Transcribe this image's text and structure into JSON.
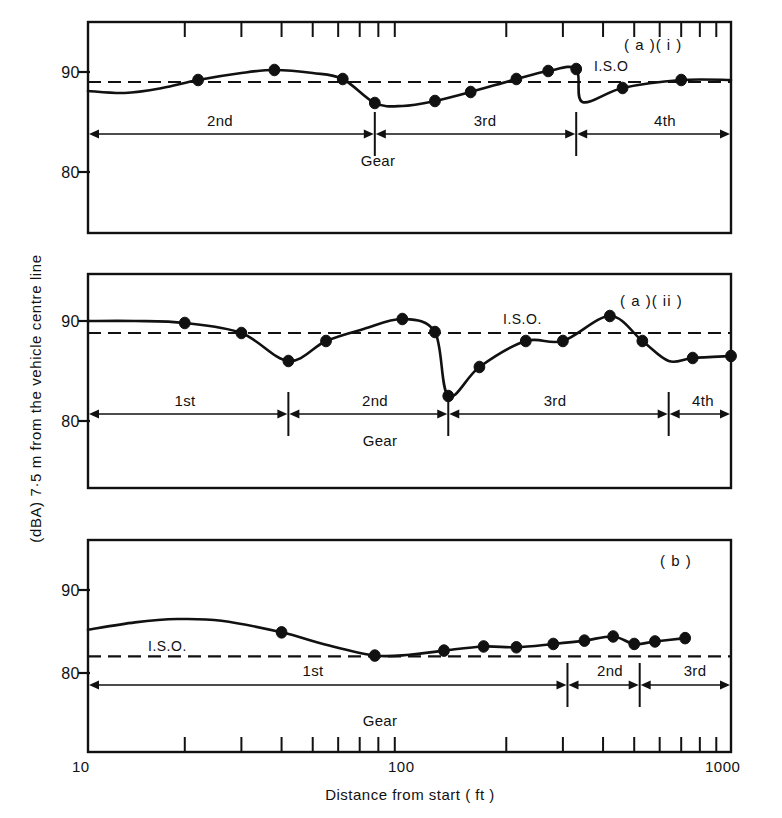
{
  "figure": {
    "axis_title_y": "(dBA) 7·5 m from the vehicle centre line",
    "axis_title_x": "Distance from start  ( ft )",
    "x_tick_labels": [
      "10",
      "100",
      "1000"
    ],
    "gear_caption": "Gear",
    "iso_label_short": "I.S.O",
    "iso_label_long": "I.S.O."
  },
  "chart_data": {
    "type": "line",
    "xlabel": "Distance from start  ( ft )",
    "ylabel": "(dBA) 7·5 m from the vehicle centre line",
    "xscale": "log",
    "xlim": [
      10,
      1000
    ],
    "ylim": [
      75,
      95
    ],
    "x_ticks_major": [
      10,
      100,
      1000
    ],
    "x_ticks_minor": [
      20,
      30,
      40,
      50,
      60,
      70,
      80,
      90,
      200,
      300,
      400,
      500,
      600,
      700,
      800,
      900
    ],
    "y_ticks": [
      80,
      90
    ],
    "grid": false,
    "legend": "none",
    "panels": [
      {
        "id": "a-i",
        "tag": "( a )( i )",
        "iso_label": "I.S.O",
        "iso_value": 89.0,
        "ylim": [
          75,
          95
        ],
        "gear_caption": "Gear",
        "gears": [
          {
            "label": "2nd",
            "x_start": 10,
            "x_end": 78
          },
          {
            "label": "3rd",
            "x_start": 78,
            "x_end": 330
          },
          {
            "label": "4th",
            "x_start": 330,
            "x_end": 1000
          }
        ],
        "gear_change_x": [
          78,
          330
        ],
        "series": [
          {
            "name": "noise",
            "points": [
              {
                "x": 10,
                "y": 88.1
              },
              {
                "x": 13,
                "y": 87.9
              },
              {
                "x": 17,
                "y": 88.4
              },
              {
                "x": 22,
                "y": 89.2
              },
              {
                "x": 30,
                "y": 89.9
              },
              {
                "x": 38,
                "y": 90.2
              },
              {
                "x": 50,
                "y": 89.9
              },
              {
                "x": 62,
                "y": 89.3
              },
              {
                "x": 78,
                "y": 86.9
              },
              {
                "x": 95,
                "y": 86.6
              },
              {
                "x": 120,
                "y": 87.1
              },
              {
                "x": 155,
                "y": 88.0
              },
              {
                "x": 215,
                "y": 89.3
              },
              {
                "x": 270,
                "y": 90.1
              },
              {
                "x": 330,
                "y": 90.3
              },
              {
                "x": 345,
                "y": 87.0
              },
              {
                "x": 460,
                "y": 88.4
              },
              {
                "x": 700,
                "y": 89.2
              },
              {
                "x": 1000,
                "y": 89.2
              }
            ],
            "markers_x": [
              22,
              38,
              62,
              78,
              120,
              155,
              215,
              270,
              330,
              460,
              700
            ],
            "markers_y": [
              89.2,
              90.2,
              89.3,
              86.9,
              87.1,
              88.0,
              89.3,
              90.1,
              90.3,
              88.4,
              89.2
            ]
          }
        ]
      },
      {
        "id": "a-ii",
        "tag": "( a )( ii )",
        "iso_label": "I.S.O.",
        "iso_value": 88.8,
        "ylim": [
          75,
          95
        ],
        "gear_caption": "Gear",
        "gears": [
          {
            "label": "1st",
            "x_start": 10,
            "x_end": 42
          },
          {
            "label": "2nd",
            "x_start": 42,
            "x_end": 132
          },
          {
            "label": "3rd",
            "x_start": 132,
            "x_end": 640
          },
          {
            "label": "4th",
            "x_start": 640,
            "x_end": 1000
          }
        ],
        "gear_change_x": [
          42,
          132,
          640
        ],
        "series": [
          {
            "name": "noise",
            "points": [
              {
                "x": 10,
                "y": 90.0
              },
              {
                "x": 14,
                "y": 90.0
              },
              {
                "x": 20,
                "y": 89.8
              },
              {
                "x": 30,
                "y": 88.8
              },
              {
                "x": 42,
                "y": 86.0
              },
              {
                "x": 55,
                "y": 88.0
              },
              {
                "x": 72,
                "y": 89.2
              },
              {
                "x": 95,
                "y": 90.2
              },
              {
                "x": 120,
                "y": 88.9
              },
              {
                "x": 132,
                "y": 82.5
              },
              {
                "x": 165,
                "y": 85.4
              },
              {
                "x": 230,
                "y": 88.0
              },
              {
                "x": 300,
                "y": 88.0
              },
              {
                "x": 420,
                "y": 90.5
              },
              {
                "x": 530,
                "y": 88.0
              },
              {
                "x": 640,
                "y": 86.0
              },
              {
                "x": 760,
                "y": 86.3
              },
              {
                "x": 1000,
                "y": 86.5
              }
            ],
            "markers_x": [
              20,
              30,
              42,
              55,
              95,
              120,
              132,
              165,
              230,
              300,
              420,
              530,
              760,
              1000
            ],
            "markers_y": [
              89.8,
              88.8,
              86.0,
              88.0,
              90.2,
              88.9,
              82.5,
              85.4,
              88.0,
              88.0,
              90.5,
              88.0,
              86.3,
              86.5
            ]
          }
        ]
      },
      {
        "id": "b",
        "tag": "( b )",
        "iso_label": "I.S.O.",
        "iso_value": 82.0,
        "ylim": [
          75,
          95
        ],
        "gear_caption": "Gear",
        "gears": [
          {
            "label": "1st",
            "x_start": 10,
            "x_end": 310
          },
          {
            "label": "2nd",
            "x_start": 310,
            "x_end": 520
          },
          {
            "label": "3rd",
            "x_start": 520,
            "x_end": 1000
          }
        ],
        "gear_change_x": [
          310,
          520
        ],
        "series": [
          {
            "name": "noise",
            "points": [
              {
                "x": 10,
                "y": 85.2
              },
              {
                "x": 14,
                "y": 86.1
              },
              {
                "x": 19,
                "y": 86.5
              },
              {
                "x": 26,
                "y": 86.3
              },
              {
                "x": 40,
                "y": 84.9
              },
              {
                "x": 55,
                "y": 83.4
              },
              {
                "x": 78,
                "y": 82.1
              },
              {
                "x": 100,
                "y": 82.2
              },
              {
                "x": 128,
                "y": 82.7
              },
              {
                "x": 170,
                "y": 83.2
              },
              {
                "x": 215,
                "y": 83.1
              },
              {
                "x": 280,
                "y": 83.5
              },
              {
                "x": 350,
                "y": 83.9
              },
              {
                "x": 430,
                "y": 84.4
              },
              {
                "x": 500,
                "y": 83.5
              },
              {
                "x": 580,
                "y": 83.8
              },
              {
                "x": 720,
                "y": 84.2
              }
            ],
            "markers_x": [
              40,
              78,
              128,
              170,
              215,
              280,
              350,
              430,
              500,
              580,
              720
            ],
            "markers_y": [
              84.9,
              82.1,
              82.7,
              83.2,
              83.1,
              83.5,
              83.9,
              84.4,
              83.5,
              83.8,
              84.2
            ]
          }
        ]
      }
    ]
  }
}
